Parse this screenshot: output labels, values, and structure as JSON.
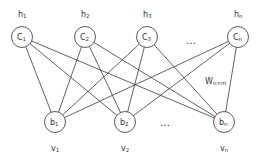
{
  "diagram": {
    "type": "bipartite-network",
    "hidden_layer": {
      "nodes": [
        {
          "id": "c1",
          "base": "C",
          "sub": "1",
          "label_base": "h",
          "label_sub": "1",
          "cx": 22,
          "cy": 37
        },
        {
          "id": "c2",
          "base": "C",
          "sub": "2",
          "label_base": "h",
          "label_sub": "2",
          "cx": 85,
          "cy": 37
        },
        {
          "id": "c3",
          "base": "C",
          "sub": "3",
          "label_base": "h",
          "label_sub": "3",
          "cx": 147,
          "cy": 37
        },
        {
          "id": "cn",
          "base": "C",
          "sub": "n",
          "label_base": "h",
          "label_sub": "n",
          "cx": 238,
          "cy": 37
        }
      ],
      "ellipsis": "…"
    },
    "visible_layer": {
      "nodes": [
        {
          "id": "b1",
          "base": "b",
          "sub": "1",
          "label_base": "v",
          "label_sub": "1",
          "cx": 55,
          "cy": 122
        },
        {
          "id": "b2",
          "base": "b",
          "sub": "2",
          "label_base": "v",
          "label_sub": "2",
          "cx": 125,
          "cy": 122
        },
        {
          "id": "bn",
          "base": "b",
          "sub": "n",
          "label_base": "v",
          "label_sub": "n",
          "cx": 224,
          "cy": 122
        }
      ],
      "ellipsis": "…"
    },
    "weight_label": {
      "base": "W",
      "sub": "n×m"
    },
    "connectivity": "fully-connected",
    "colors": {
      "stroke": "#3a3a3a",
      "node_fill": "#ffffff",
      "text": "#333333"
    }
  }
}
